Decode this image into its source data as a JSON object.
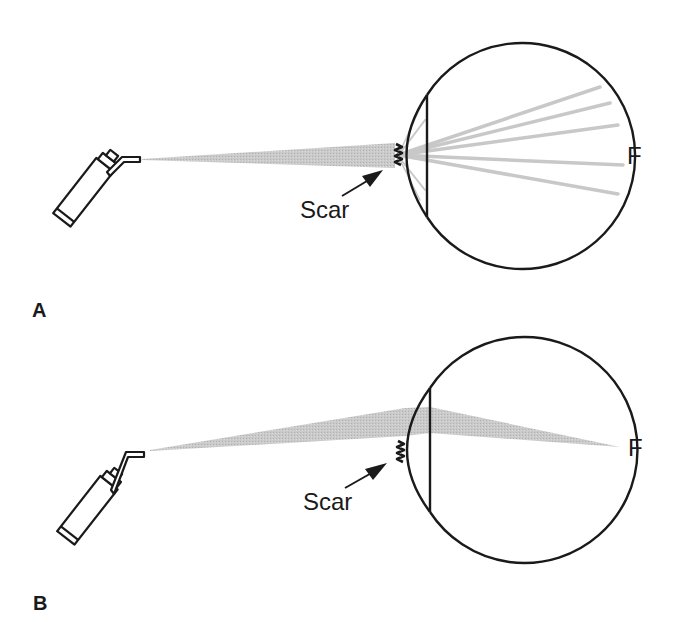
{
  "figure": {
    "colors": {
      "line": "#1a1a1a",
      "beam": "#bdbdbd",
      "background": "#ffffff"
    },
    "panels": [
      {
        "id": "A",
        "label": "A",
        "scar_label": "Scar",
        "focus_label": "F",
        "beam": "scattered by scar into multiple rays across retina"
      },
      {
        "id": "B",
        "label": "B",
        "scar_label": "Scar",
        "focus_label": "F",
        "beam": "passes through clear cornea above scar, focused at F"
      }
    ],
    "icons": {
      "instrument": "laser-pen-icon",
      "eye": "eye-cross-section-icon",
      "arrow": "pointer-arrow-icon"
    }
  }
}
